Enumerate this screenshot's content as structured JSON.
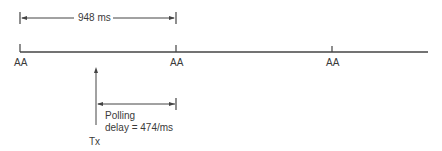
{
  "diagram": {
    "interval_label": "948 ms",
    "marker_labels": [
      "AA",
      "AA",
      "AA"
    ],
    "tx_label": "Tx",
    "polling_label_line1": "Polling",
    "polling_label_line2": "delay = 474/ms",
    "line_color": "#444444"
  }
}
